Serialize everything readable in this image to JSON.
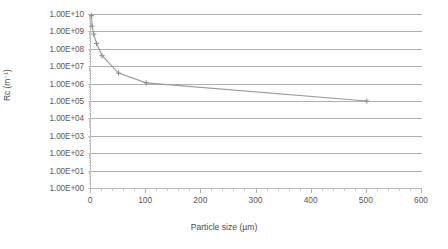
{
  "chart_data": {
    "type": "line",
    "title": "",
    "xlabel": "Particle size (µm)",
    "ylabel": "Rᴄ (m⁻¹)",
    "ylabel_plain": "Rc (m-1)",
    "xlim": [
      0,
      600
    ],
    "ylim": [
      1,
      10000000000
    ],
    "yscale": "log",
    "grid": true,
    "legend": "none",
    "xticks": [
      0,
      100,
      200,
      300,
      400,
      500,
      600
    ],
    "xtick_labels": [
      "0",
      "100",
      "200",
      "300",
      "400",
      "500",
      "600"
    ],
    "x_minor_tick_interval": 20,
    "yticks": [
      1,
      10,
      100,
      1000,
      10000,
      100000,
      1000000,
      10000000,
      100000000,
      1000000000,
      10000000000
    ],
    "ytick_labels": [
      "1.00E+10",
      "1.00E+09",
      "1.00E+08",
      "1.00E+07",
      "1.00E+06",
      "1.00E+05",
      "1.00E+04",
      "1.00E+03",
      "1.00E+02",
      "1.00E+01",
      "1.00E+00"
    ],
    "series": [
      {
        "name": "Rc vs particle size",
        "color": "#9a9a9a",
        "marker": "plus",
        "marker_color": "#8a8a8a",
        "x": [
          1,
          2,
          5,
          10,
          20,
          50,
          100,
          500
        ],
        "y": [
          8000000000,
          2000000000,
          700000000,
          200000000,
          40000000,
          4000000,
          1100000,
          100000
        ]
      }
    ]
  },
  "axes": {
    "y_title": "Rᴄ (m⁻¹)",
    "x_title": "Particle size (µm)"
  },
  "style": {
    "grid_color": "#b0b0b0",
    "axis_color": "#b9b9b9",
    "text_color": "#5a5a5a",
    "line_color": "#9a9a9a",
    "background": "#ffffff"
  }
}
